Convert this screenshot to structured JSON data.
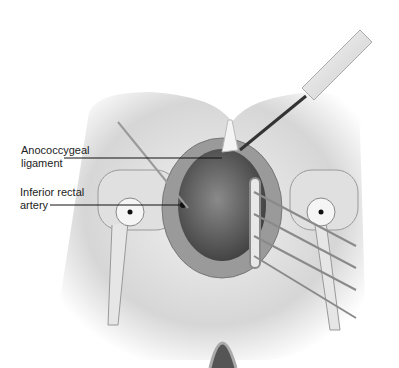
{
  "figure": {
    "labels": [
      {
        "id": "anococcygeal",
        "line1": "Anococcygeal",
        "line2": "ligament"
      },
      {
        "id": "inferior-rectal",
        "line1": "Inferior rectal",
        "line2": "artery"
      }
    ],
    "colors": {
      "skin": "#d9d9d9",
      "tissue": "#6e6e6e",
      "metal": "#bdbdbd",
      "leader": "#111111"
    }
  }
}
